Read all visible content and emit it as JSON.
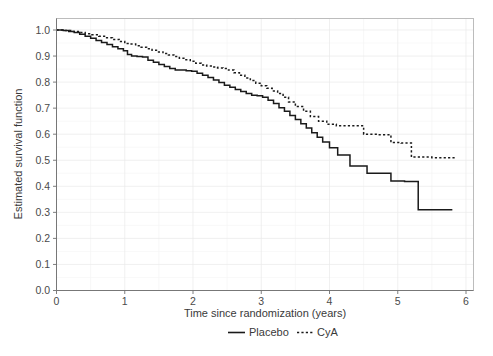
{
  "chart_data": {
    "type": "line",
    "title": "",
    "xlabel": "Time since randomization (years)",
    "ylabel": "Estimated survival function",
    "xlim": [
      0,
      6.2
    ],
    "ylim": [
      0,
      1.02
    ],
    "grid": true,
    "legend_position": "bottom",
    "xticks": [
      "0",
      "1",
      "2",
      "3",
      "4",
      "5",
      "6"
    ],
    "xtick_values": [
      0,
      1,
      2,
      3,
      4,
      5,
      6
    ],
    "yticks": [
      "0.0",
      "0.1",
      "0.2",
      "0.3",
      "0.4",
      "0.5",
      "0.6",
      "0.7",
      "0.8",
      "0.9",
      "1.0"
    ],
    "ytick_values": [
      0.0,
      0.1,
      0.2,
      0.3,
      0.4,
      0.5,
      0.6,
      0.7,
      0.8,
      0.9,
      1.0
    ],
    "series": [
      {
        "name": "Placebo",
        "style": "solid",
        "color": "#1a1a1a",
        "x": [
          0.0,
          0.1,
          0.18,
          0.26,
          0.34,
          0.42,
          0.5,
          0.58,
          0.66,
          0.74,
          0.82,
          0.9,
          0.98,
          1.04,
          1.1,
          1.18,
          1.26,
          1.34,
          1.42,
          1.5,
          1.58,
          1.66,
          1.74,
          1.82,
          1.9,
          1.98,
          2.06,
          2.14,
          2.22,
          2.3,
          2.38,
          2.46,
          2.54,
          2.62,
          2.7,
          2.78,
          2.86,
          2.94,
          3.02,
          3.1,
          3.18,
          3.26,
          3.34,
          3.42,
          3.5,
          3.58,
          3.66,
          3.74,
          3.82,
          3.9,
          4.0,
          4.12,
          4.3,
          4.55,
          4.7,
          4.9,
          5.1,
          5.3,
          5.8
        ],
        "y": [
          1.0,
          0.998,
          0.994,
          0.99,
          0.984,
          0.976,
          0.968,
          0.96,
          0.952,
          0.944,
          0.936,
          0.928,
          0.92,
          0.906,
          0.9,
          0.898,
          0.896,
          0.884,
          0.876,
          0.868,
          0.86,
          0.852,
          0.846,
          0.846,
          0.844,
          0.842,
          0.834,
          0.826,
          0.818,
          0.808,
          0.798,
          0.788,
          0.78,
          0.772,
          0.764,
          0.756,
          0.75,
          0.748,
          0.742,
          0.73,
          0.718,
          0.702,
          0.688,
          0.672,
          0.656,
          0.64,
          0.624,
          0.606,
          0.588,
          0.57,
          0.548,
          0.52,
          0.478,
          0.45,
          0.45,
          0.42,
          0.418,
          0.31,
          0.31
        ]
      },
      {
        "name": "CyA",
        "style": "dotted",
        "color": "#1a1a1a",
        "x": [
          0.0,
          0.12,
          0.22,
          0.32,
          0.42,
          0.52,
          0.62,
          0.72,
          0.82,
          0.92,
          1.0,
          1.08,
          1.16,
          1.24,
          1.32,
          1.4,
          1.48,
          1.56,
          1.64,
          1.72,
          1.8,
          1.88,
          1.96,
          2.04,
          2.12,
          2.2,
          2.28,
          2.36,
          2.44,
          2.52,
          2.6,
          2.68,
          2.76,
          2.84,
          2.92,
          3.0,
          3.08,
          3.16,
          3.24,
          3.32,
          3.4,
          3.5,
          3.62,
          3.72,
          3.84,
          3.96,
          4.1,
          4.3,
          4.5,
          4.7,
          4.9,
          5.05,
          5.2,
          5.5,
          5.85
        ],
        "y": [
          1.0,
          0.998,
          0.994,
          0.99,
          0.986,
          0.982,
          0.976,
          0.97,
          0.964,
          0.956,
          0.948,
          0.946,
          0.94,
          0.934,
          0.928,
          0.922,
          0.916,
          0.91,
          0.904,
          0.898,
          0.892,
          0.886,
          0.88,
          0.872,
          0.866,
          0.862,
          0.858,
          0.854,
          0.852,
          0.846,
          0.836,
          0.826,
          0.816,
          0.806,
          0.796,
          0.786,
          0.776,
          0.766,
          0.756,
          0.742,
          0.724,
          0.706,
          0.688,
          0.668,
          0.65,
          0.638,
          0.632,
          0.632,
          0.6,
          0.598,
          0.568,
          0.566,
          0.512,
          0.51,
          0.51
        ]
      }
    ],
    "legend": [
      {
        "label": "Placebo",
        "style": "solid"
      },
      {
        "label": "CyA",
        "style": "dotted"
      }
    ]
  }
}
